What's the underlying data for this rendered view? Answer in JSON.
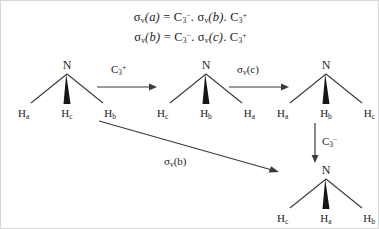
{
  "figure": {
    "type": "diagram",
    "background_color": "#ffffff",
    "stroke_color": "#3a3a3a",
    "text_color": "#1c1c1c"
  },
  "equations": [
    {
      "id": "eq1",
      "parts": {
        "lhs_sigma": "σ",
        "lhs_sub": "v",
        "lhs_arg": "(a)",
        "equals": "=",
        "t1_sym": "C",
        "t1_sub": "3",
        "t1_sup": "−",
        "dot1": ".",
        "t2_sigma": "σ",
        "t2_sub": "v",
        "t2_arg": "(b)",
        "dot2": ".",
        "t3_sym": "C",
        "t3_sub": "3",
        "t3_sup": "+"
      },
      "plain": "σv(a) = C3− . σv(b) . C3+"
    },
    {
      "id": "eq2",
      "parts": {
        "lhs_sigma": "σ",
        "lhs_sub": "v",
        "lhs_arg": "(b)",
        "equals": "=",
        "t1_sym": "C",
        "t1_sub": "3",
        "t1_sup": "−",
        "dot1": ".",
        "t2_sigma": "σ",
        "t2_sub": "v",
        "t2_arg": "(c)",
        "dot2": ".",
        "t3_sym": "C",
        "t3_sub": "3",
        "t3_sup": "+"
      },
      "plain": "σv(b) = C3− . σv(c) . C3+"
    }
  ],
  "molecules": [
    {
      "id": "mol1",
      "center_atom": "N",
      "hydrogens": [
        {
          "position": "left",
          "label": "H",
          "sub": "a"
        },
        {
          "position": "middle",
          "label": "H",
          "sub": "c"
        },
        {
          "position": "right",
          "label": "H",
          "sub": "b"
        }
      ],
      "wedge_position": "middle"
    },
    {
      "id": "mol2",
      "center_atom": "N",
      "hydrogens": [
        {
          "position": "left",
          "label": "H",
          "sub": "c"
        },
        {
          "position": "middle",
          "label": "H",
          "sub": "b"
        },
        {
          "position": "right",
          "label": "H",
          "sub": "a"
        }
      ],
      "wedge_position": "middle"
    },
    {
      "id": "mol3",
      "center_atom": "N",
      "hydrogens": [
        {
          "position": "left",
          "label": "H",
          "sub": "a"
        },
        {
          "position": "middle",
          "label": "H",
          "sub": "b"
        },
        {
          "position": "right",
          "label": "H",
          "sub": "c"
        }
      ],
      "wedge_position": "middle"
    },
    {
      "id": "mol4",
      "center_atom": "N",
      "hydrogens": [
        {
          "position": "left",
          "label": "H",
          "sub": "c"
        },
        {
          "position": "middle",
          "label": "H",
          "sub": "a"
        },
        {
          "position": "right",
          "label": "H",
          "sub": "b"
        }
      ],
      "wedge_position": "middle"
    }
  ],
  "arrows": [
    {
      "id": "arrow1",
      "direction": "right",
      "from": "mol1",
      "to": "mol2",
      "label": {
        "sym": "C",
        "sub": "3",
        "sup": "+"
      },
      "label_plain": "C3+"
    },
    {
      "id": "arrow2",
      "direction": "right",
      "from": "mol2",
      "to": "mol3",
      "label": {
        "sym": "σ",
        "sub": "v",
        "arg": "(c)"
      },
      "label_plain": "σv (c)"
    },
    {
      "id": "arrow3",
      "direction": "down",
      "from": "mol3",
      "to": "mol4",
      "label": {
        "sym": "C",
        "sub": "3",
        "sup": "−"
      },
      "label_plain": "C3−"
    },
    {
      "id": "arrow4",
      "direction": "diagonal-down-right",
      "from": "mol1",
      "to": "mol4",
      "label": {
        "sym": "σ",
        "sub": "v",
        "arg": "(b)"
      },
      "label_plain": "σv (b)"
    }
  ]
}
